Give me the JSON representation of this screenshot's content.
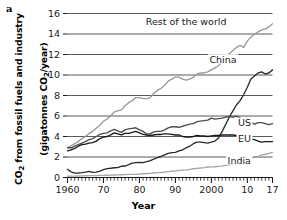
{
  "figure": {
    "panel_label": "a",
    "xlabel": "Year",
    "ylabel_line1": "CO2 from fossil fuels and industry",
    "ylabel_line2": "(gigatonnes CO2/year)",
    "ylabel_text": "CO₂ from fossil fuels and industry\n(gigatonnes CO₂/year)"
  },
  "chart_data": {
    "type": "line",
    "title": "",
    "xlabel": "Year",
    "ylabel": "CO₂ from fossil fuels and industry (gigatonnes CO₂/year)",
    "xlim": [
      1960,
      2017
    ],
    "ylim": [
      0,
      16
    ],
    "yticks": [
      0,
      2,
      4,
      6,
      8,
      10,
      12,
      14,
      16
    ],
    "ytick_labels": [
      "0",
      "2",
      "4",
      "6",
      "8",
      "10",
      "12",
      "14",
      "16"
    ],
    "xticks": [
      1960,
      1970,
      1980,
      1990,
      2000,
      2010,
      2017
    ],
    "xtick_labels": [
      "1960",
      "70",
      "80",
      "90",
      "2000",
      "10",
      "17"
    ],
    "minor_xticks_interval": 1,
    "grid": "horizontal",
    "grid_color": "#595959",
    "legend_position": "inline-annotations",
    "x": [
      1960,
      1961,
      1962,
      1963,
      1964,
      1965,
      1966,
      1967,
      1968,
      1969,
      1970,
      1971,
      1972,
      1973,
      1974,
      1975,
      1976,
      1977,
      1978,
      1979,
      1980,
      1981,
      1982,
      1983,
      1984,
      1985,
      1986,
      1987,
      1988,
      1989,
      1990,
      1991,
      1992,
      1993,
      1994,
      1995,
      1996,
      1997,
      1998,
      1999,
      2000,
      2001,
      2002,
      2003,
      2004,
      2005,
      2006,
      2007,
      2008,
      2009,
      2010,
      2011,
      2012,
      2013,
      2014,
      2015,
      2016,
      2017
    ],
    "series": [
      {
        "name": "Rest of the world",
        "color": "#9a9a9a",
        "label_x": 1993,
        "label_y": 14.9,
        "values": [
          2.9,
          3.1,
          3.3,
          3.5,
          3.8,
          4.0,
          4.3,
          4.5,
          4.8,
          5.1,
          5.5,
          5.7,
          6.0,
          6.4,
          6.5,
          6.6,
          7.0,
          7.3,
          7.5,
          7.8,
          7.8,
          7.7,
          7.7,
          7.8,
          8.2,
          8.5,
          8.7,
          9.0,
          9.4,
          9.6,
          9.8,
          9.8,
          9.6,
          9.5,
          9.6,
          9.8,
          10.1,
          10.2,
          10.2,
          10.3,
          10.5,
          10.7,
          10.9,
          11.3,
          11.8,
          12.1,
          12.4,
          12.7,
          12.9,
          12.7,
          13.3,
          13.7,
          14.0,
          14.2,
          14.4,
          14.5,
          14.7,
          15.0
        ]
      },
      {
        "name": "China",
        "color": "#2b2b2b",
        "label_x": 2007,
        "label_y": 11.2,
        "values": [
          0.8,
          0.55,
          0.43,
          0.44,
          0.47,
          0.53,
          0.6,
          0.5,
          0.52,
          0.63,
          0.77,
          0.86,
          0.9,
          0.95,
          0.97,
          1.1,
          1.12,
          1.25,
          1.4,
          1.45,
          1.47,
          1.45,
          1.55,
          1.65,
          1.8,
          1.93,
          2.05,
          2.2,
          2.35,
          2.42,
          2.45,
          2.6,
          2.7,
          2.9,
          3.05,
          3.3,
          3.45,
          3.45,
          3.4,
          3.35,
          3.45,
          3.55,
          3.85,
          4.5,
          5.2,
          5.9,
          6.5,
          7.1,
          7.5,
          8.1,
          8.8,
          9.6,
          9.9,
          10.2,
          10.3,
          10.1,
          10.2,
          10.5
        ]
      },
      {
        "name": "US",
        "color": "#4d4d4d",
        "label_x": 2011,
        "label_y": 5.0,
        "values": [
          2.9,
          2.9,
          3.05,
          3.2,
          3.35,
          3.5,
          3.7,
          3.8,
          4.0,
          4.2,
          4.3,
          4.35,
          4.55,
          4.7,
          4.55,
          4.4,
          4.65,
          4.75,
          4.8,
          4.85,
          4.65,
          4.5,
          4.25,
          4.25,
          4.45,
          4.5,
          4.5,
          4.65,
          4.85,
          4.95,
          4.95,
          4.9,
          5.0,
          5.1,
          5.2,
          5.25,
          5.45,
          5.5,
          5.55,
          5.6,
          5.8,
          5.7,
          5.75,
          5.8,
          5.9,
          5.95,
          5.9,
          6.0,
          5.8,
          5.4,
          5.55,
          5.4,
          5.2,
          5.35,
          5.35,
          5.25,
          5.15,
          5.25
        ]
      },
      {
        "name": "EU",
        "color": "#1a1a1a",
        "label_x": 2011,
        "label_y": 3.45,
        "values": [
          2.6,
          2.7,
          2.85,
          3.05,
          3.2,
          3.25,
          3.35,
          3.4,
          3.55,
          3.8,
          3.95,
          4.0,
          4.15,
          4.35,
          4.25,
          4.15,
          4.3,
          4.3,
          4.4,
          4.5,
          4.35,
          4.2,
          4.15,
          4.1,
          4.15,
          4.2,
          4.2,
          4.25,
          4.25,
          4.2,
          4.15,
          4.15,
          4.0,
          3.95,
          3.95,
          4.0,
          4.1,
          4.05,
          4.05,
          4.0,
          4.05,
          4.1,
          4.1,
          4.15,
          4.15,
          4.15,
          4.15,
          4.1,
          4.05,
          3.75,
          3.85,
          3.75,
          3.7,
          3.55,
          3.45,
          3.5,
          3.5,
          3.5
        ]
      },
      {
        "name": "India",
        "color": "#a6a6a6",
        "label_x": 2011,
        "label_y": 1.35,
        "values": [
          0.12,
          0.13,
          0.14,
          0.15,
          0.16,
          0.17,
          0.18,
          0.18,
          0.19,
          0.2,
          0.21,
          0.22,
          0.23,
          0.24,
          0.25,
          0.27,
          0.28,
          0.3,
          0.31,
          0.33,
          0.34,
          0.37,
          0.39,
          0.41,
          0.44,
          0.47,
          0.49,
          0.53,
          0.57,
          0.61,
          0.65,
          0.69,
          0.72,
          0.75,
          0.79,
          0.85,
          0.89,
          0.93,
          0.96,
          1.02,
          1.03,
          1.05,
          1.08,
          1.11,
          1.18,
          1.24,
          1.32,
          1.43,
          1.53,
          1.66,
          1.73,
          1.84,
          1.98,
          2.05,
          2.21,
          2.27,
          2.35,
          2.45
        ]
      }
    ]
  }
}
